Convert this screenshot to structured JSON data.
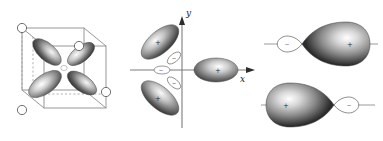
{
  "figure": {
    "background_color": "#ffffff",
    "line_color": "#8a8a8a",
    "lobe_dark": "#3d3d3d",
    "lobe_light": "#f2f2f2",
    "panels": [
      {
        "id": "cube-orbital",
        "name": "d-orbital-in-cube",
        "description": "Four-lobed orbital inside a cube with ligand circles at four alternating corners",
        "cube": {
          "vertex_circles": 4,
          "solid_edges": 9,
          "dashed_edges": 3,
          "circle_fill": "#ffffff",
          "circle_stroke": "#6e6e6e"
        },
        "orbital": {
          "type": "four-lobe",
          "lobe_count": 4,
          "lobes": [
            {
              "name": "upper-left-lobe",
              "angle_deg": 122
            },
            {
              "name": "upper-right-lobe",
              "angle_deg": 38
            },
            {
              "name": "lower-left-lobe",
              "angle_deg": 215
            },
            {
              "name": "lower-right-lobe",
              "angle_deg": 330
            }
          ]
        }
      },
      {
        "id": "axes-orbital",
        "name": "three-lobe-orbital-on-axes",
        "axes": {
          "y_label": "y",
          "x_label": "x",
          "y_arrow": true,
          "x_arrow": true,
          "axis_color": "#7d7d7d"
        },
        "orbital": {
          "type": "three-lobe-with-nodal-ring",
          "large_lobes": [
            {
              "name": "upper-left-lobe",
              "sign": "+",
              "angle_deg": 139
            },
            {
              "name": "lower-left-lobe",
              "sign": "+",
              "angle_deg": 221
            },
            {
              "name": "right-lobe",
              "sign": "+",
              "angle_deg": 0
            }
          ],
          "small_lobes": [
            {
              "name": "small-upper-lobe",
              "sign": "−"
            },
            {
              "name": "small-left-lobe",
              "sign": "−"
            },
            {
              "name": "small-lower-lobe",
              "sign": "−"
            }
          ]
        }
      },
      {
        "id": "hybrid-pair",
        "name": "hybrid-orbital-pair",
        "orbitals": [
          {
            "name": "upper-hybrid-orbital",
            "major_lobe": {
              "name": "major-lobe",
              "sign": "+",
              "side": "right"
            },
            "minor_lobe": {
              "name": "minor-lobe",
              "sign": "−",
              "side": "left"
            },
            "axis_line": true
          },
          {
            "name": "lower-hybrid-orbital",
            "major_lobe": {
              "name": "major-lobe",
              "sign": "+",
              "side": "left"
            },
            "minor_lobe": {
              "name": "minor-lobe",
              "sign": "−",
              "side": "right"
            },
            "axis_line": true
          }
        ]
      }
    ]
  }
}
